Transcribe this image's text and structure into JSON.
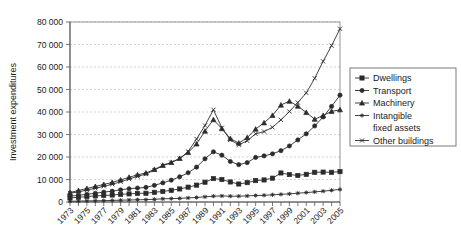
{
  "chart_data": {
    "type": "line",
    "title": "",
    "xlabel": "",
    "ylabel": "Investment expenditures",
    "ylim": [
      0,
      80000
    ],
    "ytick_labels": [
      "0",
      "10 000",
      "20 000",
      "30 000",
      "40 000",
      "50 000",
      "60 000",
      "70 000",
      "80 000"
    ],
    "ytick_values": [
      0,
      10000,
      20000,
      30000,
      40000,
      50000,
      60000,
      70000,
      80000
    ],
    "grid": true,
    "legend_position": "right",
    "x": [
      1973,
      1974,
      1975,
      1976,
      1977,
      1978,
      1979,
      1980,
      1981,
      1982,
      1983,
      1984,
      1985,
      1986,
      1987,
      1988,
      1989,
      1990,
      1991,
      1992,
      1993,
      1994,
      1995,
      1996,
      1997,
      1998,
      1999,
      2000,
      2001,
      2002,
      2003,
      2004,
      2005
    ],
    "xtick_labels": [
      "1973",
      "1975",
      "1977",
      "1979",
      "1981",
      "1983",
      "1985",
      "1987",
      "1989",
      "1991",
      "1993",
      "1995",
      "1997",
      "1999",
      "2001",
      "2003",
      "2005"
    ],
    "xtick_values": [
      1973,
      1975,
      1977,
      1979,
      1981,
      1983,
      1985,
      1987,
      1989,
      1991,
      1993,
      1995,
      1997,
      1999,
      2001,
      2003,
      2005
    ],
    "series": [
      {
        "name": "Dwellings",
        "marker": "square",
        "values": [
          1800,
          2100,
          2400,
          2700,
          2900,
          3100,
          3400,
          3600,
          3800,
          3900,
          4300,
          4700,
          5200,
          5800,
          6600,
          7500,
          8800,
          10400,
          10000,
          8900,
          8000,
          8600,
          9500,
          9800,
          10600,
          12900,
          12200,
          11800,
          12300,
          13200,
          13300,
          13200,
          13500
        ]
      },
      {
        "name": "Transport",
        "marker": "circle",
        "values": [
          2600,
          3000,
          3400,
          3900,
          4400,
          4800,
          5400,
          5900,
          6200,
          6500,
          7400,
          8500,
          9700,
          11200,
          13000,
          15500,
          19200,
          22300,
          20800,
          18000,
          16600,
          17500,
          19800,
          20500,
          21400,
          22800,
          24900,
          27600,
          30300,
          33800,
          37800,
          42500,
          47500
        ]
      },
      {
        "name": "Machinery",
        "marker": "triangle",
        "values": [
          4200,
          5100,
          6000,
          6900,
          7800,
          8700,
          9800,
          11000,
          12100,
          12900,
          14500,
          16300,
          17600,
          19400,
          22000,
          25800,
          31500,
          36600,
          32600,
          28200,
          26200,
          28600,
          32400,
          35200,
          38500,
          43100,
          44800,
          42600,
          39800,
          36800,
          38400,
          40300,
          41000
        ]
      },
      {
        "name": "Intangible fixed assets",
        "marker": "star",
        "values": [
          300,
          400,
          500,
          550,
          600,
          700,
          800,
          900,
          1000,
          1050,
          1200,
          1400,
          1500,
          1600,
          1800,
          2000,
          2300,
          2600,
          2700,
          2600,
          2600,
          2700,
          2900,
          3000,
          3200,
          3400,
          3600,
          3900,
          4200,
          4500,
          4800,
          5200,
          5600
        ]
      },
      {
        "name": "Other buildings",
        "marker": "cross",
        "values": [
          3900,
          4500,
          5300,
          6100,
          7000,
          7900,
          9000,
          10200,
          11400,
          12400,
          14200,
          16100,
          17500,
          19300,
          22400,
          28000,
          34000,
          41000,
          33000,
          27600,
          25400,
          27200,
          30300,
          31300,
          33200,
          36500,
          40200,
          44200,
          48500,
          55000,
          62500,
          69500,
          77000
        ]
      }
    ]
  },
  "legend": {
    "items": [
      {
        "label": "Dwellings"
      },
      {
        "label": "Transport"
      },
      {
        "label": "Machinery"
      },
      {
        "label": "Intangible"
      },
      {
        "label": "fixed assets"
      },
      {
        "label": "Other buildings"
      }
    ]
  }
}
